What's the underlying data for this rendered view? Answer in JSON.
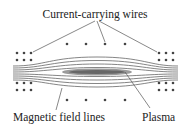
{
  "diagram": {
    "labels": {
      "wires": "Current-carrying wires",
      "field_lines": "Magnetic field lines",
      "plasma": "Plasma"
    },
    "colors": {
      "background": "#ffffff",
      "text": "#222222",
      "lines": "#555555",
      "dots": "#444444",
      "plasma": "#777777"
    }
  }
}
